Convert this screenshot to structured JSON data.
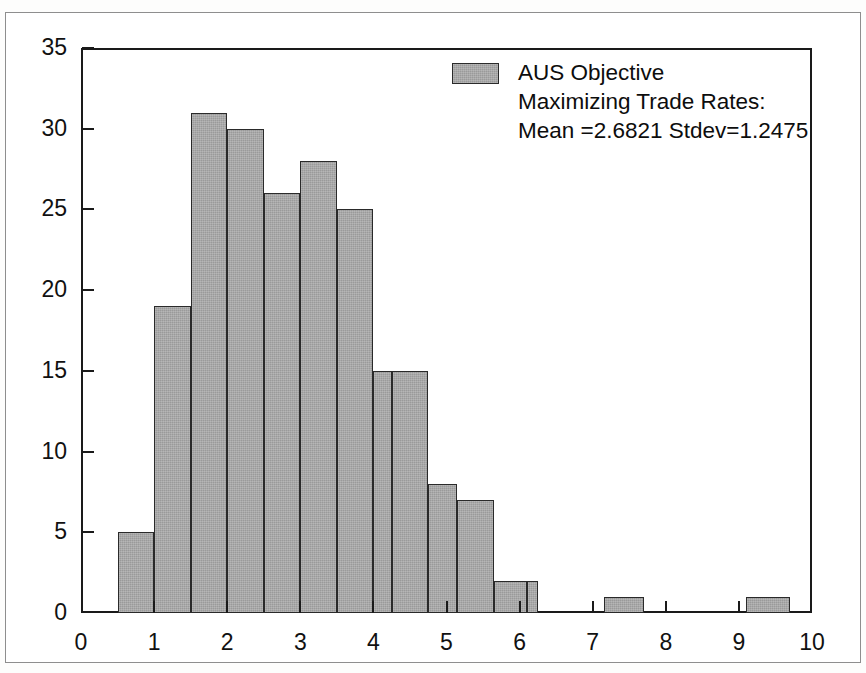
{
  "figure": {
    "background_color": "#ffffff",
    "border_color": "#8e8e8e",
    "axis_color": "#1a1a1a"
  },
  "legend": {
    "swatch_color": "#9a9a9a",
    "swatch_edge_color": "#2a2a2a",
    "line1": "AUS Objective",
    "line2": "Maximizing Trade Rates:",
    "line3": "Mean =2.6821 Stdev=1.2475"
  },
  "statistics": {
    "mean_label": "Mean =2.6821",
    "stdev_label": "Stdev=1.2475",
    "mean": 2.6821,
    "stdev": 1.2475
  },
  "chart_data": {
    "type": "bar",
    "title": "",
    "subtitle": "",
    "xlabel": "",
    "ylabel": "",
    "xlim": [
      0,
      10
    ],
    "ylim": [
      0,
      35
    ],
    "grid": false,
    "legend_position": "upper-right",
    "bin_width": 0.5,
    "bar_color": "#9a9a9a",
    "bar_edge_color": "#2a2a2a",
    "xticks": [
      0,
      1,
      2,
      3,
      4,
      5,
      6,
      7,
      8,
      9,
      10
    ],
    "xtick_labels": [
      "0",
      "1",
      "2",
      "3",
      "4",
      "5",
      "6",
      "7",
      "8",
      "9",
      "10"
    ],
    "yticks": [
      0,
      5,
      10,
      15,
      20,
      25,
      30,
      35
    ],
    "ytick_labels": [
      "0",
      "5",
      "10",
      "15",
      "20",
      "25",
      "30",
      "35"
    ],
    "series": [
      {
        "name": "AUS Objective Maximizing Trade Rates",
        "bins": [
          {
            "x0": 0.5,
            "x1": 1.0,
            "value": 5
          },
          {
            "x0": 1.0,
            "x1": 1.5,
            "value": 19
          },
          {
            "x0": 1.5,
            "x1": 2.0,
            "value": 31
          },
          {
            "x0": 2.0,
            "x1": 2.5,
            "value": 30
          },
          {
            "x0": 2.5,
            "x1": 3.0,
            "value": 26
          },
          {
            "x0": 3.0,
            "x1": 3.5,
            "value": 28
          },
          {
            "x0": 3.5,
            "x1": 4.0,
            "value": 25
          },
          {
            "x0": 4.0,
            "x1": 4.25,
            "value": 15
          },
          {
            "x0": 4.25,
            "x1": 4.75,
            "value": 15
          },
          {
            "x0": 4.75,
            "x1": 5.15,
            "value": 8
          },
          {
            "x0": 5.15,
            "x1": 5.65,
            "value": 7
          },
          {
            "x0": 5.65,
            "x1": 6.1,
            "value": 2
          },
          {
            "x0": 6.1,
            "x1": 6.25,
            "value": 2
          },
          {
            "x0": 7.15,
            "x1": 7.7,
            "value": 1
          },
          {
            "x0": 9.1,
            "x1": 9.7,
            "value": 1
          }
        ],
        "categories": [
          "0.5-1",
          "1-1.5",
          "1.5-2",
          "2-2.5",
          "2.5-3",
          "3-3.5",
          "3.5-4",
          "4-4.5",
          "4.5-5",
          "5-5.5",
          "5.5-6",
          "6-6.5",
          "7-7.5",
          "9-9.5"
        ],
        "values": [
          5,
          19,
          31,
          30,
          26,
          28,
          25,
          15,
          8,
          7,
          2,
          2,
          1,
          1
        ]
      }
    ]
  }
}
